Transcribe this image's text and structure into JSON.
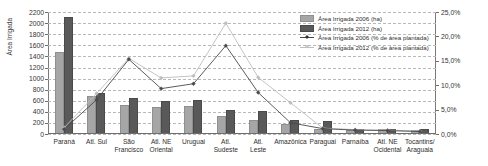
{
  "chart_data": {
    "type": "bar",
    "title": "",
    "subtitle": "",
    "xlabel": "",
    "ylabel": "Área Irrigada",
    "ylabel_right": "",
    "ylim": [
      0,
      2200
    ],
    "ytick_step": 200,
    "ylim_right": [
      0,
      25
    ],
    "ytick_step_right": 5,
    "grid": true,
    "legend_position": "top-right",
    "categories": [
      "Paraná",
      "Atl. Sul",
      "São\nFrancisco",
      "Atl. NE\nOriental",
      "Uruguai",
      "Atl.\nSudeste",
      "Atl.\nLeste",
      "Amazônica",
      "Paraguai",
      "Parnaíba",
      "Atl. NE\nOcidental",
      "Tocantins/\nAraguaia"
    ],
    "yticks_left": [
      "2200",
      "2000",
      "1800",
      "1600",
      "1400",
      "1200",
      "1000",
      "800",
      "600",
      "400",
      "200",
      "0"
    ],
    "yticks_right": [
      "25,0%",
      "20,0%",
      "15,0%",
      "10,0%",
      "5,0%",
      "0,0%"
    ],
    "series": [
      {
        "name": "Área Irrigada 2006 (ha)",
        "kind": "bar",
        "axis": "left",
        "color": "#a6a6a6",
        "values": [
          1450,
          650,
          490,
          460,
          465,
          285,
          215,
          150,
          55,
          30,
          55,
          30
        ]
      },
      {
        "name": "Área Irrigada 2012 (ha)",
        "kind": "bar",
        "axis": "left",
        "color": "#595959",
        "values": [
          2080,
          700,
          605,
          565,
          575,
          390,
          375,
          225,
          195,
          60,
          60,
          50
        ]
      },
      {
        "name": "Área Irrigada 2006 (% de área plantada)",
        "kind": "line",
        "axis": "right",
        "color": "#4a4a4a",
        "marker": "diamond",
        "values": [
          1.0,
          7.0,
          15.3,
          9.3,
          10.3,
          18.1,
          8.5,
          2.3,
          1.1,
          0.8,
          0.7,
          0.5
        ]
      },
      {
        "name": "Área Irrigada 2012 (% de área plantada)",
        "kind": "line",
        "axis": "right",
        "color": "#bdbdbd",
        "marker": "diamond",
        "values": [
          1.3,
          8.3,
          15.5,
          11.5,
          11.9,
          22.7,
          11.6,
          6.4,
          1.2,
          0.9,
          0.8,
          0.6
        ]
      }
    ]
  },
  "legend": {
    "items": [
      {
        "label": "Área Irrigada 2006 (ha)",
        "key": "bar-light"
      },
      {
        "label": "Área Irrigada 2012 (ha)",
        "key": "bar-dark"
      },
      {
        "label": "Área Irrigada 2006 (% de área plantada)",
        "key": "line-dark"
      },
      {
        "label": "Área Irrigada 2012 (% de área plantada)",
        "key": "line-pale"
      }
    ]
  },
  "colors": {
    "bar_2006": "#a6a6a6",
    "bar_2012": "#595959",
    "line_2006": "#4a4a4a",
    "line_2012": "#bdbdbd",
    "grid": "#b9b9b9",
    "axis": "#6e6e6e",
    "background": "#ffffff"
  }
}
